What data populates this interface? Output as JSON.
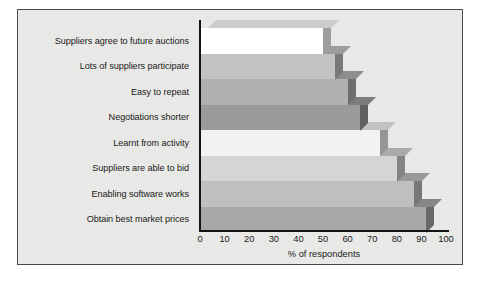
{
  "chart_data": {
    "type": "bar",
    "orientation": "horizontal",
    "title": "",
    "xlabel": "% of respondents",
    "ylabel": "",
    "xlim": [
      0,
      100
    ],
    "xticks": [
      "0",
      "10",
      "20",
      "30",
      "40",
      "50",
      "60",
      "70",
      "80",
      "90",
      "100"
    ],
    "grid": false,
    "legend": false,
    "style": "3d-bar",
    "categories": [
      "Suppliers agree to future auctions",
      "Lots of suppliers participate",
      "Easy to repeat",
      "Negotiations shorter",
      "Learnt from activity",
      "Suppliers are able to bid",
      "Enabling software works",
      "Obtain best market prices"
    ],
    "values": [
      50,
      55,
      60,
      65,
      73,
      80,
      87,
      92
    ],
    "bar_colors": [
      "#ffffff",
      "#c3c3c3",
      "#b0b0b0",
      "#9b9b9b",
      "#f2f2f2",
      "#d5d5d5",
      "#bfbfbf",
      "#a8a8a8"
    ]
  },
  "figure": {
    "background": "#ffffff",
    "panel_background": "#e8e8e6",
    "panel_border": "#4a4a4a",
    "axis_color": "#141414",
    "text_color": "#1a1a1a"
  }
}
